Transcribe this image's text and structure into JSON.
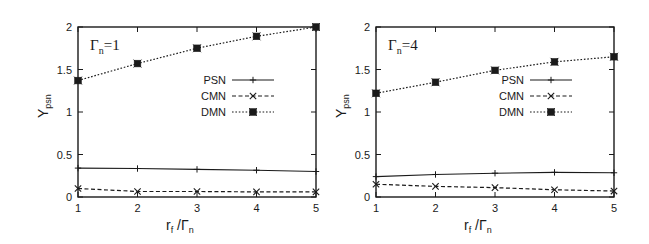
{
  "figure": {
    "panels": [
      {
        "title_main": "Γ",
        "title_sub": "n",
        "title_value": "=1",
        "xlabel_main": "r",
        "xlabel_sub1": "f",
        "xlabel_mid": " /Γ",
        "xlabel_sub2": "n",
        "ylabel_main": "Y",
        "ylabel_sub": "psn"
      },
      {
        "title_main": "Γ",
        "title_sub": "n",
        "title_value": "=4",
        "xlabel_main": "r",
        "xlabel_sub1": "f",
        "xlabel_mid": " /Γ",
        "xlabel_sub2": "n",
        "ylabel_main": "Y",
        "ylabel_sub": "psn"
      }
    ],
    "legend": [
      "PSN",
      "CMN",
      "DMN"
    ],
    "colors": {
      "line": "#1a1a1a",
      "background": "#ffffff"
    }
  },
  "chart_data": [
    {
      "type": "line",
      "title": "Γn=1",
      "xlabel": "rf /Γn",
      "ylabel": "Ypsn",
      "x": [
        1,
        2,
        3,
        4,
        5
      ],
      "xlim": [
        1,
        5
      ],
      "ylim": [
        0,
        2
      ],
      "xticks": [
        "1",
        "2",
        "3",
        "4",
        "5"
      ],
      "yticks": [
        "0",
        "0.5",
        "1",
        "1.5",
        "2"
      ],
      "grid": false,
      "legend_position": "right-middle",
      "series": [
        {
          "name": "PSN",
          "style": "solid",
          "marker": "plus",
          "values": [
            0.34,
            0.335,
            0.325,
            0.315,
            0.3
          ]
        },
        {
          "name": "CMN",
          "style": "dashed",
          "marker": "x",
          "values": [
            0.1,
            0.065,
            0.065,
            0.06,
            0.06
          ]
        },
        {
          "name": "DMN",
          "style": "dotted",
          "marker": "square-star",
          "values": [
            1.37,
            1.57,
            1.75,
            1.89,
            2.0
          ]
        }
      ]
    },
    {
      "type": "line",
      "title": "Γn=4",
      "xlabel": "rf /Γn",
      "ylabel": "Ypsn",
      "x": [
        1,
        2,
        3,
        4,
        5
      ],
      "xlim": [
        1,
        5
      ],
      "ylim": [
        0,
        2
      ],
      "xticks": [
        "1",
        "2",
        "3",
        "4",
        "5"
      ],
      "yticks": [
        "0",
        "0.5",
        "1",
        "1.5",
        "2"
      ],
      "grid": false,
      "legend_position": "right-middle",
      "series": [
        {
          "name": "PSN",
          "style": "solid",
          "marker": "plus",
          "values": [
            0.24,
            0.265,
            0.28,
            0.29,
            0.285
          ]
        },
        {
          "name": "CMN",
          "style": "dashed",
          "marker": "x",
          "values": [
            0.15,
            0.125,
            0.11,
            0.085,
            0.07
          ]
        },
        {
          "name": "DMN",
          "style": "dotted",
          "marker": "square-star",
          "values": [
            1.22,
            1.35,
            1.49,
            1.59,
            1.65
          ]
        }
      ]
    }
  ]
}
